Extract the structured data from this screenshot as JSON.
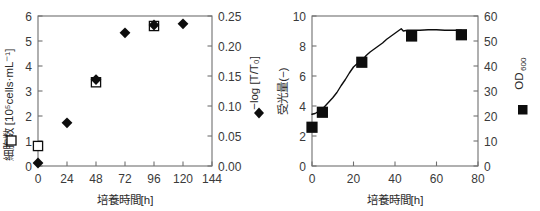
{
  "figure": {
    "panel_count": 2,
    "background_color": "#ffffff",
    "marker_color": "#0d0d0d",
    "axis_color": "#6f6f6f"
  },
  "chart_data": [
    {
      "id": "left-panel",
      "type": "scatter",
      "title": "",
      "xlabel": "培養時間",
      "xlabel_unit": "[h]",
      "xlim": [
        0,
        144
      ],
      "xticks": [
        0,
        24,
        48,
        72,
        96,
        120,
        144
      ],
      "xticklabels": [
        "0",
        "24",
        "48",
        "72",
        "96",
        "120",
        "144"
      ],
      "ylabel_left": "細胞数",
      "ylabel_left_unit": "[10⁵cells·mL⁻¹]",
      "ylim_left": [
        0,
        6
      ],
      "yticks_left": [
        0,
        1,
        2,
        3,
        4,
        5,
        6
      ],
      "yticklabels_left": [
        "0",
        "1",
        "2",
        "3",
        "4",
        "5",
        "6"
      ],
      "ylabel_right": "−log [T/T₀]",
      "ylim_right": [
        0.0,
        0.25
      ],
      "yticks_right": [
        0.0,
        0.05,
        0.1,
        0.15,
        0.2,
        0.25
      ],
      "yticklabels_right": [
        "0.00",
        "0.05",
        "0.10",
        "0.15",
        "0.20",
        "0.25"
      ],
      "grid": false,
      "legend_position": "axis-label-inline",
      "series": [
        {
          "name": "細胞数",
          "marker": "open-square",
          "axis": "left",
          "x": [
            0,
            48,
            96
          ],
          "values": [
            0.8,
            3.35,
            5.6
          ]
        },
        {
          "name": "−log [T/T₀]",
          "marker": "filled-diamond",
          "axis": "right",
          "x": [
            0,
            24,
            48,
            72,
            96,
            120
          ],
          "values": [
            0.005,
            0.072,
            0.144,
            0.222,
            0.235,
            0.237
          ]
        }
      ]
    },
    {
      "id": "right-panel",
      "type": "line",
      "title": "",
      "xlabel": "培養時間",
      "xlabel_unit": "[h]",
      "xlim": [
        0,
        80
      ],
      "xticks": [
        0,
        20,
        40,
        60,
        80
      ],
      "xticklabels": [
        "0",
        "20",
        "40",
        "60",
        "80"
      ],
      "ylabel_left": "受光量",
      "ylabel_left_unit": "(−)",
      "ylim_left": [
        0,
        10
      ],
      "yticks_left": [
        0,
        2,
        4,
        6,
        8,
        10
      ],
      "yticklabels_left": [
        "0",
        "2",
        "4",
        "6",
        "8",
        "10"
      ],
      "ylabel_right": "OD",
      "ylabel_right_sub": "600",
      "ylim_right": [
        0,
        60
      ],
      "yticks_right": [
        0,
        10,
        20,
        30,
        40,
        50,
        60
      ],
      "yticklabels_right": [
        "0",
        "10",
        "20",
        "30",
        "40",
        "50",
        "60"
      ],
      "grid": false,
      "legend_position": "axis-label-inline",
      "series": [
        {
          "name": "受光量",
          "marker": "line",
          "axis": "left",
          "x": [
            0,
            1.5,
            3,
            4.5,
            6,
            8,
            10,
            12,
            14,
            16,
            18,
            20,
            22,
            24,
            26,
            28,
            30,
            32,
            34,
            36,
            38,
            40,
            42,
            43,
            44,
            46,
            48,
            52,
            56,
            60,
            64,
            68,
            72
          ],
          "values": [
            3.45,
            3.5,
            3.62,
            3.78,
            3.95,
            4.25,
            4.55,
            4.9,
            5.35,
            5.75,
            6.2,
            6.6,
            6.85,
            7.0,
            7.35,
            7.6,
            7.8,
            8.0,
            8.2,
            8.45,
            8.65,
            8.85,
            9.05,
            9.15,
            9.0,
            9.05,
            9.05,
            9.05,
            9.08,
            9.08,
            9.05,
            9.05,
            9.05
          ]
        },
        {
          "name": "OD600",
          "marker": "filled-square",
          "axis": "right",
          "x": [
            0,
            5,
            24,
            48,
            72
          ],
          "values": [
            15.5,
            21.5,
            41.5,
            52.0,
            52.5
          ]
        }
      ]
    }
  ]
}
